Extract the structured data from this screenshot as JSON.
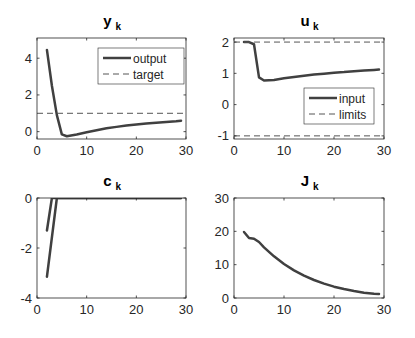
{
  "chart_data": [
    {
      "type": "line",
      "title": "y",
      "title_subscript": "k",
      "xlabel": "",
      "ylabel": "",
      "xlim": [
        0,
        30
      ],
      "ylim": [
        -0.4,
        5.1
      ],
      "xticks": [
        0,
        10,
        20,
        30
      ],
      "yticks": [
        0,
        2,
        4
      ],
      "grid": false,
      "legend_position": "upper right",
      "box": {
        "left": 37,
        "top": 38,
        "right": 186,
        "bottom": 139
      },
      "legend": {
        "x": 98,
        "y": 48,
        "w": 86,
        "h": 36
      },
      "series": [
        {
          "name": "output",
          "style": "solid",
          "color": "#404040",
          "width": 2.5,
          "x": [
            2,
            3,
            4,
            5,
            6,
            8,
            10,
            12,
            14,
            16,
            18,
            20,
            22,
            24,
            26,
            28,
            29
          ],
          "y": [
            4.45,
            2.5,
            0.9,
            -0.15,
            -0.25,
            -0.15,
            -0.03,
            0.08,
            0.18,
            0.26,
            0.33,
            0.39,
            0.44,
            0.49,
            0.53,
            0.57,
            0.6
          ]
        },
        {
          "name": "target",
          "style": "dashed",
          "color": "#555555",
          "width": 1,
          "x": [
            0,
            30
          ],
          "y": [
            1,
            1
          ]
        }
      ]
    },
    {
      "type": "line",
      "title": "u",
      "title_subscript": "k",
      "xlabel": "",
      "ylabel": "",
      "xlim": [
        0,
        30
      ],
      "ylim": [
        -1.1,
        2.13
      ],
      "xticks": [
        0,
        10,
        20,
        30
      ],
      "yticks": [
        -1,
        0,
        1,
        2
      ],
      "grid": false,
      "legend_position": "lower right",
      "box": {
        "left": 234,
        "top": 38,
        "right": 384,
        "bottom": 139
      },
      "legend": {
        "x": 304,
        "y": 88,
        "w": 70,
        "h": 36
      },
      "series": [
        {
          "name": "input",
          "style": "solid",
          "color": "#404040",
          "width": 2.5,
          "x": [
            2,
            3,
            4,
            5,
            6,
            8,
            10,
            12,
            14,
            16,
            18,
            20,
            22,
            24,
            26,
            28,
            29
          ],
          "y": [
            2.0,
            2.0,
            1.93,
            0.87,
            0.77,
            0.79,
            0.84,
            0.88,
            0.92,
            0.96,
            0.99,
            1.02,
            1.04,
            1.07,
            1.09,
            1.11,
            1.12
          ]
        },
        {
          "name": "limits",
          "style": "dashed",
          "color": "#555555",
          "width": 1,
          "x": [
            0,
            30
          ],
          "y": [
            2,
            2
          ]
        },
        {
          "name": "limits_lower",
          "style": "dashed",
          "color": "#555555",
          "width": 1,
          "x": [
            0,
            30
          ],
          "y": [
            -1,
            -1
          ]
        }
      ]
    },
    {
      "type": "line",
      "title": "c",
      "title_subscript": "k",
      "xlabel": "",
      "ylabel": "",
      "xlim": [
        0,
        30
      ],
      "ylim": [
        -4,
        0
      ],
      "xticks": [
        0,
        10,
        20,
        30
      ],
      "yticks": [
        -4,
        -2,
        0
      ],
      "grid": false,
      "box": {
        "left": 37,
        "top": 198,
        "right": 186,
        "bottom": 298
      },
      "series": [
        {
          "name": "constraint_1",
          "style": "solid",
          "color": "#404040",
          "width": 2.5,
          "x": [
            2,
            3,
            29
          ],
          "y": [
            -1.3,
            0,
            0
          ]
        },
        {
          "name": "constraint_2",
          "style": "solid",
          "color": "#404040",
          "width": 2.5,
          "x": [
            2,
            4,
            29
          ],
          "y": [
            -3.15,
            0,
            0
          ]
        }
      ]
    },
    {
      "type": "line",
      "title": "J",
      "title_subscript": "k",
      "xlabel": "",
      "ylabel": "",
      "xlim": [
        0,
        30
      ],
      "ylim": [
        0,
        30
      ],
      "xticks": [
        0,
        10,
        20,
        30
      ],
      "yticks": [
        0,
        10,
        20,
        30
      ],
      "grid": false,
      "box": {
        "left": 234,
        "top": 198,
        "right": 384,
        "bottom": 298
      },
      "series": [
        {
          "name": "cost",
          "style": "solid",
          "color": "#404040",
          "width": 2.5,
          "x": [
            2,
            3,
            4,
            5,
            6,
            8,
            10,
            12,
            14,
            16,
            18,
            20,
            22,
            24,
            26,
            28,
            29
          ],
          "y": [
            19.8,
            18.0,
            17.8,
            16.8,
            15.2,
            12.5,
            10.2,
            8.3,
            6.7,
            5.4,
            4.3,
            3.4,
            2.7,
            2.1,
            1.6,
            1.3,
            1.2
          ]
        }
      ]
    }
  ]
}
